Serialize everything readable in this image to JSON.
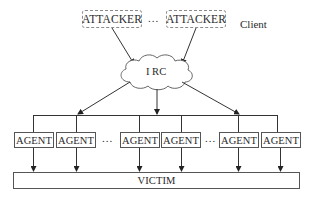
{
  "diagram": {
    "type": "network-topology",
    "client_label": "Client",
    "attackers": [
      {
        "label": "ATTACKER"
      },
      {
        "label": "ATTACKER"
      }
    ],
    "attacker_separator": "...",
    "hub": {
      "label": "I RC",
      "shape": "cloud"
    },
    "agents": [
      {
        "label": "AGENT"
      },
      {
        "label": "AGENT"
      },
      {
        "label": "AGENT"
      },
      {
        "label": "AGENT"
      },
      {
        "label": "AGENT"
      },
      {
        "label": "AGENT"
      }
    ],
    "agent_separators": [
      "...",
      "..."
    ],
    "target": {
      "label": "VICTIM"
    },
    "edges": [
      {
        "from": "attacker-1",
        "to": "irc"
      },
      {
        "from": "attacker-2",
        "to": "irc"
      },
      {
        "from": "irc",
        "to": "agent-bus"
      },
      {
        "from": "agent-bus",
        "to": "agents"
      },
      {
        "from": "agents",
        "to": "victim"
      }
    ]
  }
}
